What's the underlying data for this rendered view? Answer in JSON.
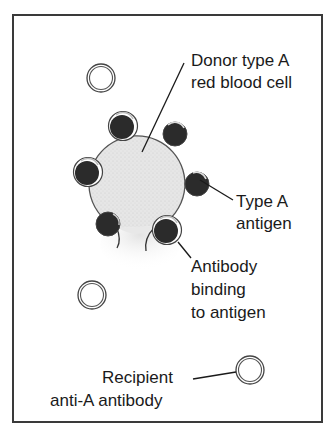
{
  "diagram": {
    "labels": {
      "donor_cell": [
        "Donor type A",
        "red blood cell"
      ],
      "antigen": [
        "Type A",
        "antigen"
      ],
      "bound_antibody": [
        "Antibody",
        "binding",
        "to antigen"
      ],
      "recipient_antibody": [
        "Recipient",
        "anti-A antibody"
      ]
    },
    "colors": {
      "frame": "#3a3a3a",
      "cell_fill": "#e2e2e2",
      "cell_outline": "#555555",
      "antigen_fill": "#2b2b2b",
      "antibody_ring": "#444444",
      "text": "#1a1a1a"
    },
    "elements": {
      "red_blood_cell": {
        "cx": 143,
        "cy": 182,
        "r": 48
      },
      "antigens": [
        {
          "cx": 123,
          "cy": 126,
          "r": 13,
          "bound": true
        },
        {
          "cx": 175,
          "cy": 134,
          "r": 12,
          "bound": false
        },
        {
          "cx": 88,
          "cy": 172,
          "r": 13,
          "bound": true
        },
        {
          "cx": 197,
          "cy": 184,
          "r": 12,
          "bound": false
        },
        {
          "cx": 108,
          "cy": 224,
          "r": 12,
          "bound": false
        },
        {
          "cx": 167,
          "cy": 230,
          "r": 13,
          "bound": true
        }
      ],
      "free_antibodies": [
        {
          "cx": 101,
          "cy": 78,
          "r": 14
        },
        {
          "cx": 92,
          "cy": 295,
          "r": 14
        },
        {
          "cx": 250,
          "cy": 370,
          "r": 14
        }
      ]
    }
  }
}
